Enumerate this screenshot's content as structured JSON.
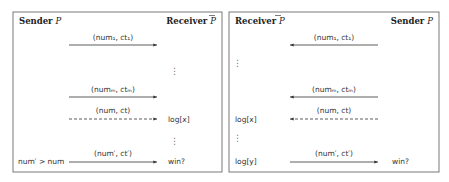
{
  "panels": [
    {
      "id": "left",
      "header_left": {
        "text": "Sender ",
        "symbol": "P",
        "overline": false
      },
      "header_right": {
        "text": "Receiver ",
        "symbol": "P",
        "overline": true
      },
      "messages": [
        {
          "label": "(num₁, ct₁)",
          "direction": "right",
          "style": "solid",
          "left_note": "",
          "right_note": ""
        },
        {
          "label": "(numₘ, ctₘ)",
          "direction": "right",
          "style": "solid",
          "left_note": "",
          "right_note": ""
        },
        {
          "label": "(num, ct)",
          "direction": "right",
          "style": "dashed",
          "left_note": "",
          "right_note": "log[x]"
        },
        {
          "label": "(num′, ct′)",
          "direction": "right",
          "style": "solid",
          "left_note": "num′ > num",
          "right_note": "win?"
        }
      ],
      "ellipses": [
        "⋮",
        "⋮"
      ]
    },
    {
      "id": "right",
      "header_left": {
        "text": "Receiver ",
        "symbol": "P",
        "overline": true
      },
      "header_right": {
        "text": "Sender ",
        "symbol": "P",
        "overline": false
      },
      "messages": [
        {
          "label": "(num₁, ct₁)",
          "direction": "left",
          "style": "solid",
          "left_note": "",
          "right_note": ""
        },
        {
          "label": "(numₘ, ctₘ)",
          "direction": "left",
          "style": "solid",
          "left_note": "",
          "right_note": ""
        },
        {
          "label": "(num, ct)",
          "direction": "left",
          "style": "dashed",
          "left_note": "log[x]",
          "right_note": ""
        },
        {
          "label": "(num′, ct′)",
          "direction": "right",
          "style": "solid",
          "left_note": "log[y]",
          "right_note": "win?"
        }
      ],
      "ellipses": [
        "⋮",
        "⋮"
      ]
    }
  ]
}
